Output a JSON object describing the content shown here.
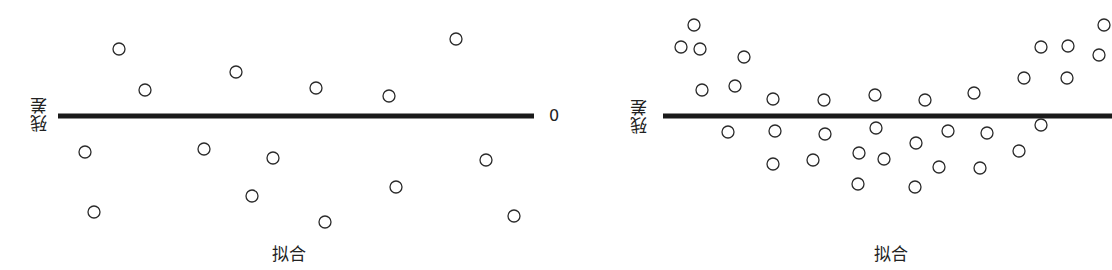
{
  "chart_data": [
    {
      "type": "scatter",
      "title": "",
      "xlabel": "拟合",
      "ylabel": "残差",
      "reference_line": {
        "y": 0,
        "label": "0"
      },
      "grid": false,
      "pattern": "random scatter around zero",
      "points_px": [
        [
          119,
          49
        ],
        [
          145,
          90
        ],
        [
          85,
          152
        ],
        [
          94,
          212
        ],
        [
          204,
          149
        ],
        [
          236,
          72
        ],
        [
          252,
          196
        ],
        [
          273,
          158
        ],
        [
          316,
          88
        ],
        [
          325,
          222
        ],
        [
          389,
          96
        ],
        [
          396,
          187
        ],
        [
          456,
          39
        ],
        [
          486,
          160
        ],
        [
          514,
          216
        ]
      ],
      "line_px": {
        "x1": 58,
        "x2": 534,
        "y": 116
      }
    },
    {
      "type": "scatter",
      "title": "",
      "xlabel": "拟合",
      "ylabel": "残差",
      "reference_line": {
        "y": 0,
        "label": "0"
      },
      "grid": false,
      "pattern": "U-shaped (curved) residual pattern",
      "points_px": [
        [
          138,
          25
        ],
        [
          125,
          47
        ],
        [
          144,
          49
        ],
        [
          188,
          57
        ],
        [
          146,
          90
        ],
        [
          179,
          86
        ],
        [
          217,
          99
        ],
        [
          268,
          100
        ],
        [
          319,
          95
        ],
        [
          369,
          100
        ],
        [
          418,
          93
        ],
        [
          468,
          78
        ],
        [
          485,
          47
        ],
        [
          512,
          46
        ],
        [
          511,
          78
        ],
        [
          543,
          55
        ],
        [
          548,
          25
        ],
        [
          172,
          132
        ],
        [
          219,
          131
        ],
        [
          269,
          134
        ],
        [
          320,
          128
        ],
        [
          392,
          131
        ],
        [
          431,
          133
        ],
        [
          485,
          125
        ],
        [
          217,
          164
        ],
        [
          257,
          160
        ],
        [
          303,
          153
        ],
        [
          328,
          159
        ],
        [
          360,
          143
        ],
        [
          383,
          167
        ],
        [
          424,
          168
        ],
        [
          463,
          151
        ],
        [
          302,
          184
        ],
        [
          359,
          187
        ]
      ],
      "line_px": {
        "x1": 107,
        "x2": 556,
        "y": 116
      }
    }
  ],
  "left": {
    "ylabel": "残差",
    "xlabel": "拟合",
    "zero_label": "0"
  },
  "right": {
    "ylabel": "残差",
    "xlabel": "拟合"
  },
  "colors": {
    "line": "#1a1a1a",
    "marker_stroke": "#2a2a2a",
    "text": "#222222"
  }
}
